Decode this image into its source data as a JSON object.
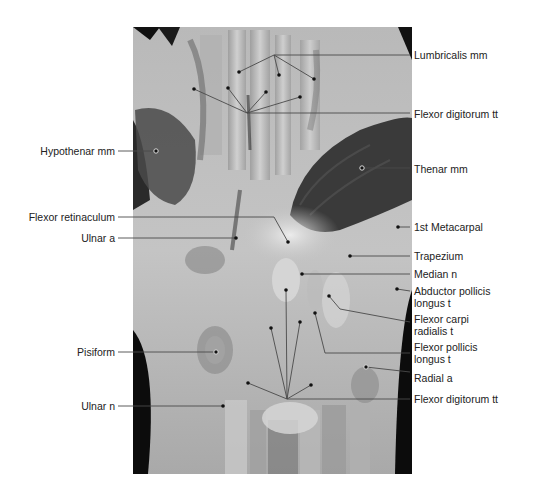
{
  "figure": {
    "type": "anatomical cross-section photograph, wrist (carpal tunnel)",
    "photo_bounds": {
      "x": 133,
      "y": 27,
      "width": 279,
      "height": 447
    },
    "colors": {
      "background": "#ffffff",
      "leader_line": "#555555",
      "label_text": "#222222",
      "pin": "#111111"
    }
  },
  "labels_right": [
    {
      "id": "lumbricalis",
      "text": "Lumbricalis mm",
      "x": 414,
      "y": 55
    },
    {
      "id": "flexor-digitorum-top",
      "text": "Flexor digitorum tt",
      "x": 414,
      "y": 114
    },
    {
      "id": "thenar",
      "text": "Thenar mm",
      "x": 414,
      "y": 169
    },
    {
      "id": "first-metacarpal",
      "text": "1st Metacarpal",
      "x": 414,
      "y": 227
    },
    {
      "id": "trapezium",
      "text": "Trapezium",
      "x": 414,
      "y": 256
    },
    {
      "id": "median-n",
      "text": "Median n",
      "x": 414,
      "y": 274
    },
    {
      "id": "abductor-pollicis",
      "text": "Abductor pollicis\nlongus t",
      "x": 414,
      "y": 290
    },
    {
      "id": "flexor-carpi-radialis",
      "text": "Flexor carpi\nradialis t",
      "x": 414,
      "y": 318
    },
    {
      "id": "flexor-pollicis-longus",
      "text": "Flexor pollicis\nlongus t",
      "x": 414,
      "y": 346
    },
    {
      "id": "radial-a",
      "text": "Radial a",
      "x": 414,
      "y": 378
    },
    {
      "id": "flexor-digitorum-bottom",
      "text": "Flexor digitorum tt",
      "x": 414,
      "y": 398
    }
  ],
  "labels_left": [
    {
      "id": "hypothenar",
      "text": "Hypothenar mm",
      "x_right": 115,
      "y": 151
    },
    {
      "id": "flexor-retinaculum",
      "text": "Flexor retinaculum",
      "x_right": 115,
      "y": 217
    },
    {
      "id": "ulnar-a",
      "text": "Ulnar a",
      "x_right": 115,
      "y": 238
    },
    {
      "id": "pisiform",
      "text": "Pisiform",
      "x_right": 115,
      "y": 352
    },
    {
      "id": "ulnar-n",
      "text": "Ulnar n",
      "x_right": 115,
      "y": 406
    }
  ]
}
